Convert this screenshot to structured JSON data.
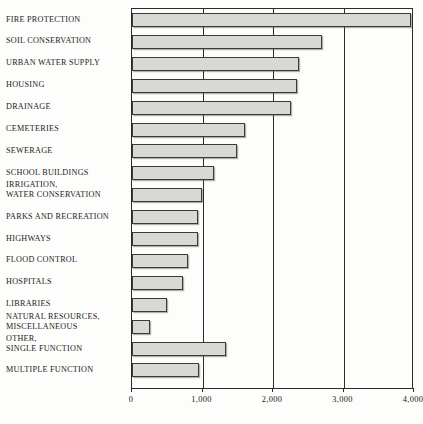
{
  "chart_data": {
    "type": "bar",
    "orientation": "horizontal",
    "title": "",
    "subtitle": "",
    "xlabel": "",
    "ylabel": "",
    "xlim": [
      0,
      4000
    ],
    "grid": true,
    "legend": null,
    "xticks": [
      0,
      1000,
      2000,
      3000,
      4000
    ],
    "xtick_labels": [
      "0",
      "1,000",
      "2,000",
      "3,000",
      "4,000"
    ],
    "categories": [
      "FIRE PROTECTION",
      "SOIL CONSERVATION",
      "URBAN WATER SUPPLY",
      "HOUSING",
      "DRAINAGE",
      "CEMETERIES",
      "SEWERAGE",
      "SCHOOL BUILDINGS",
      "IRRIGATION, WATER CONSERVATION",
      "PARKS AND RECREATION",
      "HIGHWAYS",
      "FLOOD CONTROL",
      "HOSPITALS",
      "LIBRARIES",
      "NATURAL RESOURCES, MISCELLANEOUS",
      "OTHER, SINGLE FUNCTION",
      "MULTIPLE FUNCTION"
    ],
    "category_lines": [
      [
        "FIRE PROTECTION"
      ],
      [
        "SOIL CONSERVATION"
      ],
      [
        "URBAN WATER SUPPLY"
      ],
      [
        "HOUSING"
      ],
      [
        "DRAINAGE"
      ],
      [
        "CEMETERIES"
      ],
      [
        "SEWERAGE"
      ],
      [
        "SCHOOL BUILDINGS"
      ],
      [
        "IRRIGATION,",
        "WATER CONSERVATION"
      ],
      [
        "PARKS AND RECREATION"
      ],
      [
        "HIGHWAYS"
      ],
      [
        "FLOOD CONTROL"
      ],
      [
        "HOSPITALS"
      ],
      [
        "LIBRARIES"
      ],
      [
        "NATURAL RESOURCES,",
        "MISCELLANEOUS"
      ],
      [
        "OTHER,",
        "SINGLE FUNCTION"
      ],
      [
        "MULTIPLE FUNCTION"
      ]
    ],
    "values": [
      3960,
      2690,
      2370,
      2340,
      2250,
      1600,
      1490,
      1170,
      990,
      930,
      930,
      800,
      730,
      500,
      250,
      1330,
      950
    ]
  },
  "style": {
    "bar_fill": "#d8d8d4",
    "bar_stroke": "#3a3a3a",
    "axis_color": "#2b2b2b",
    "background": "#fdfdfb",
    "text_color": "#1b1b1b"
  }
}
